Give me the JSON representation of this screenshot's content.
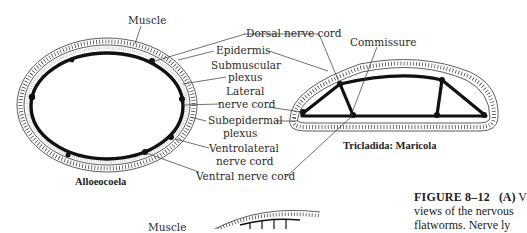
{
  "figure": {
    "left_diagram": {
      "taxon": "Alloeocoela",
      "labels": {
        "muscle": "Muscle"
      }
    },
    "right_diagram": {
      "taxon": "Tricladida:  Maricola",
      "labels": {
        "commissure": "Commissure"
      }
    },
    "shared_labels": {
      "dorsal_nerve_cord": "Dorsal nerve cord",
      "epidermis": "Epidermis",
      "submuscular_plexus_1": "Submuscular",
      "submuscular_plexus_2": "plexus",
      "lateral_nerve_cord_1": "Lateral",
      "lateral_nerve_cord_2": "nerve cord",
      "subepidermal_plexus_1": "Subepidermal",
      "subepidermal_plexus_2": "plexus",
      "ventrolateral_nerve_cord_1": "Ventrolateral",
      "ventrolateral_nerve_cord_2": "nerve cord",
      "ventral_nerve_cord": "Ventral nerve cord"
    },
    "bottom_partial": {
      "muscle_label": "Muscle"
    },
    "caption": {
      "figure_number": "FIGURE 8–12",
      "panel": "(A)",
      "line1_tail": "V",
      "line2": "views of the nervous",
      "line3": "flatworms. Nerve ly"
    }
  },
  "colors": {
    "ink": "#1a1a1a",
    "text": "#2a2a2a",
    "background": "#ffffff"
  }
}
